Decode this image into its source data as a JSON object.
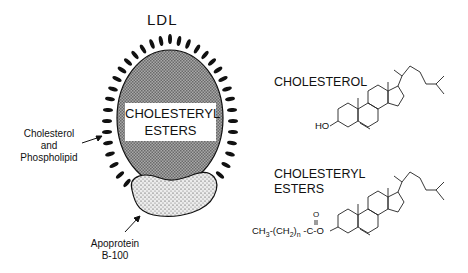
{
  "diagram": {
    "title": "LDL",
    "particle": {
      "core_label_line1": "CHOLESTERYL",
      "core_label_line2": "ESTERS",
      "surface_label_line1": "Cholesterol",
      "surface_label_line2": "and",
      "surface_label_line3": "Phospholipid",
      "protein_label_line1": "Apoprotein",
      "protein_label_line2": "B-100"
    },
    "structures": [
      {
        "name": "CHOLESTEROL",
        "substituent": "HO"
      },
      {
        "name_line1": "CHOLESTERYL",
        "name_line2": "ESTERS",
        "substituent": "CH3-(CH2)n-C(=O)-O"
      }
    ],
    "ester_formula": {
      "part1": "CH",
      "sub1": "3",
      "part2": "-(CH",
      "sub2": "2",
      "part3": ")",
      "sub3": "n",
      "part4": " -C-O",
      "carbonyl_o": "O"
    },
    "colors": {
      "ink": "#111111",
      "core_fill": "#8a8a8a",
      "protein_fill": "#d8d8d8",
      "background": "#ffffff"
    }
  }
}
